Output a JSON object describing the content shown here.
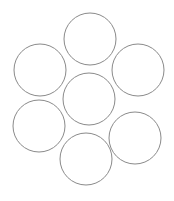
{
  "diagram": {
    "type": "circle-packing",
    "stroke_color": "#8a8a8a",
    "background": "#ffffff",
    "circles": [
      {
        "id": "top",
        "cx": 90,
        "cy": 39,
        "r": 26
      },
      {
        "id": "upper-left",
        "cx": 40,
        "cy": 70,
        "r": 26
      },
      {
        "id": "upper-right",
        "cx": 138,
        "cy": 70,
        "r": 26
      },
      {
        "id": "center",
        "cx": 89,
        "cy": 99,
        "r": 26
      },
      {
        "id": "lower-left",
        "cx": 39,
        "cy": 126,
        "r": 26
      },
      {
        "id": "lower-right",
        "cx": 135,
        "cy": 138,
        "r": 26
      },
      {
        "id": "bottom",
        "cx": 86,
        "cy": 159,
        "r": 26
      }
    ]
  }
}
